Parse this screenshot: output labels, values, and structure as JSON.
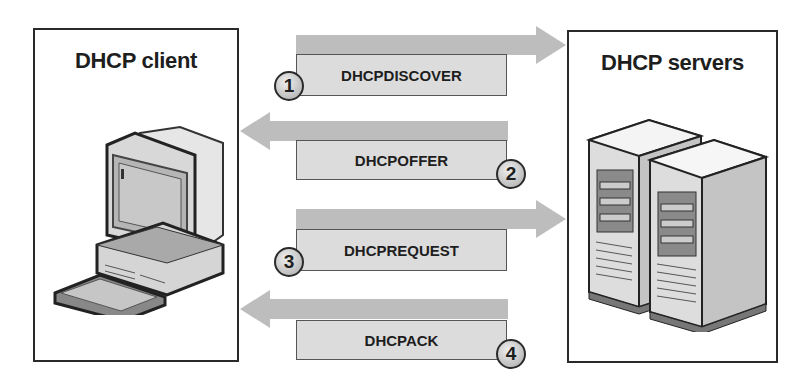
{
  "client": {
    "title": "DHCP client",
    "icon": "desktop-computer-icon"
  },
  "servers": {
    "title": "DHCP servers",
    "icon": "server-towers-icon"
  },
  "messages": [
    {
      "step": "1",
      "label": "DHCPDISCOVER",
      "direction": "client-to-server"
    },
    {
      "step": "2",
      "label": "DHCPOFFER",
      "direction": "server-to-client"
    },
    {
      "step": "3",
      "label": "DHCPREQUEST",
      "direction": "client-to-server"
    },
    {
      "step": "4",
      "label": "DHCPACK",
      "direction": "server-to-client"
    }
  ],
  "colors": {
    "arrow": "#bdbdbd",
    "label_fill": "#dcdcdc",
    "border": "#2a2a2a"
  }
}
